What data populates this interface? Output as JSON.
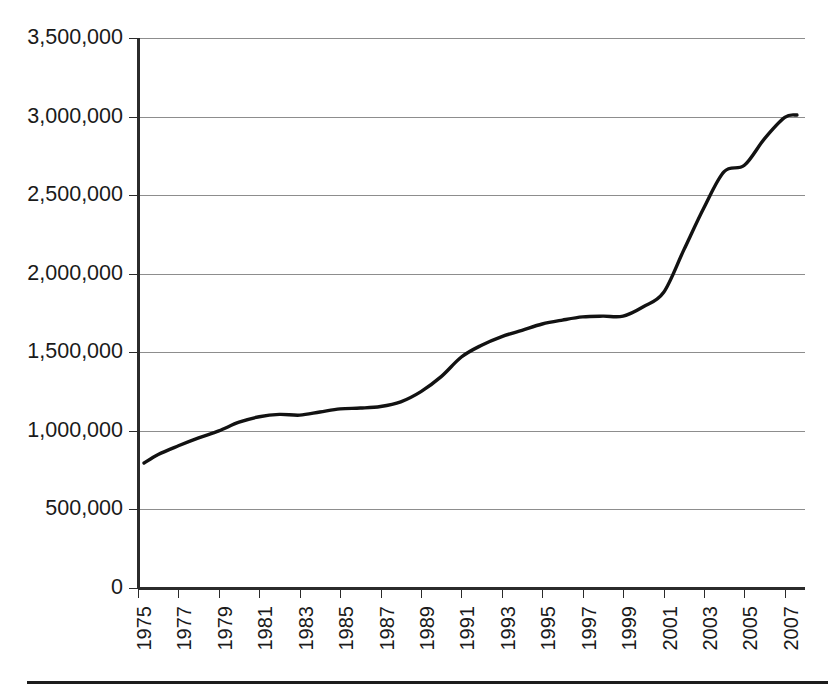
{
  "chart_data": {
    "type": "line",
    "title": "",
    "subtitle": "",
    "xlabel": "",
    "ylabel": "",
    "grid": true,
    "legend": false,
    "legend_position": "none",
    "line_color": "#121212",
    "grid_color": "#8d8d8d",
    "axis_color": "#2b2b2b",
    "xlim": [
      1975,
      2008
    ],
    "ylim": [
      0,
      3500000
    ],
    "x_tick_step": 2,
    "y_tick_step": 500000,
    "x_tick_labels": [
      "1975",
      "1977",
      "1979",
      "1981",
      "1983",
      "1985",
      "1987",
      "1989",
      "1991",
      "1993",
      "1995",
      "1997",
      "1999",
      "2001",
      "2003",
      "2005",
      "2007"
    ],
    "x_tick_values": [
      1975,
      1977,
      1979,
      1981,
      1983,
      1985,
      1987,
      1989,
      1991,
      1993,
      1995,
      1997,
      1999,
      2001,
      2003,
      2005,
      2007
    ],
    "x_tick_rotation": -90,
    "y_tick_labels": [
      "0",
      "500,000",
      "1,000,000",
      "1,500,000",
      "2,000,000",
      "2,500,000",
      "3,000,000",
      "3,500,000"
    ],
    "y_tick_values": [
      0,
      500000,
      1000000,
      1500000,
      2000000,
      2500000,
      3000000,
      3500000
    ],
    "x": [
      1975.3,
      1976,
      1977,
      1978,
      1979,
      1980,
      1981,
      1982,
      1983,
      1984,
      1985,
      1986,
      1987,
      1988,
      1989,
      1990,
      1991,
      1992,
      1993,
      1994,
      1995,
      1996,
      1997,
      1998,
      1999,
      2000,
      2001,
      2002,
      2003,
      2004,
      2005,
      2006,
      2007,
      2007.6
    ],
    "values": [
      795000,
      850000,
      905000,
      955000,
      1000000,
      1055000,
      1090000,
      1105000,
      1100000,
      1120000,
      1140000,
      1145000,
      1155000,
      1185000,
      1250000,
      1345000,
      1470000,
      1545000,
      1600000,
      1640000,
      1680000,
      1705000,
      1725000,
      1730000,
      1730000,
      1790000,
      1880000,
      2150000,
      2420000,
      2650000,
      2690000,
      2860000,
      2995000,
      3010000
    ],
    "series": [
      {
        "name": "",
        "values": [
          795000,
          850000,
          905000,
          955000,
          1000000,
          1055000,
          1090000,
          1105000,
          1100000,
          1120000,
          1140000,
          1145000,
          1155000,
          1185000,
          1250000,
          1345000,
          1470000,
          1545000,
          1600000,
          1640000,
          1680000,
          1705000,
          1725000,
          1730000,
          1730000,
          1790000,
          1880000,
          2150000,
          2420000,
          2650000,
          2690000,
          2860000,
          2995000,
          3010000
        ]
      }
    ]
  },
  "footer": {
    "rule_visible": true
  }
}
